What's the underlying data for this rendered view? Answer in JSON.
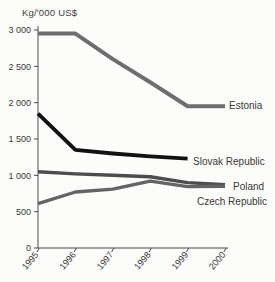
{
  "chart_data": {
    "type": "line",
    "title": "Kg/'000 US$",
    "x": [
      1995,
      1996,
      1997,
      1998,
      1999,
      2000
    ],
    "x_tick_labels": [
      "1995",
      "1996",
      "1997",
      "1998",
      "1999",
      "2000"
    ],
    "y_ticks": [
      0,
      500,
      1000,
      1500,
      2000,
      2500,
      3000
    ],
    "y_tick_labels": [
      "0",
      "500",
      "1 000",
      "1 500",
      "2 000",
      "2 500",
      "3 000"
    ],
    "ylim": [
      0,
      3000
    ],
    "xlabel": "",
    "ylabel": "Kg/'000 US$",
    "grid": false,
    "legend_position": "labels-at-line-ends",
    "axis_color": "#4a4a4a",
    "text_color": "#383838",
    "series": [
      {
        "name": "Estonia",
        "values": [
          2950,
          2950,
          2600,
          2280,
          1950,
          1950
        ],
        "color": "#6e6e6e",
        "width": 4,
        "label_anchor": {
          "x": 229,
          "y": 109
        }
      },
      {
        "name": "Slovak Republic",
        "values": [
          1850,
          1350,
          1300,
          1260,
          1230,
          null
        ],
        "color": "#121212",
        "width": 3.8,
        "label_anchor": {
          "x": 193,
          "y": 165
        }
      },
      {
        "name": "Poland",
        "values": [
          1050,
          1020,
          1000,
          980,
          900,
          870
        ],
        "color": "#4d4d4d",
        "width": 3.4,
        "label_anchor": {
          "x": 233,
          "y": 190
        }
      },
      {
        "name": "Czech Republic",
        "values": [
          610,
          770,
          810,
          920,
          845,
          850
        ],
        "color": "#646464",
        "width": 3.4,
        "label_anchor": {
          "x": 197,
          "y": 205
        }
      }
    ],
    "layout": {
      "plot": {
        "left": 38,
        "right": 225,
        "top": 30,
        "bottom": 248
      }
    }
  }
}
